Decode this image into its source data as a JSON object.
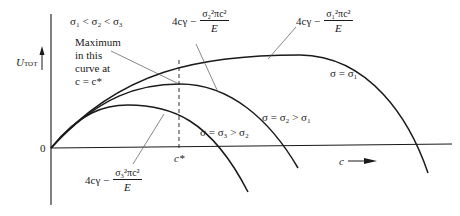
{
  "diagram": {
    "condition_label": "σ₁ < σ₂ < σ₃",
    "y_axis_label": "U",
    "y_axis_subscript": "TOT",
    "x_axis_label": "c",
    "origin_label": "0",
    "c_star_label": "c*",
    "annotation_max": [
      "Maximum",
      "in this",
      "curve at",
      "c = c*"
    ],
    "curves": [
      {
        "id": "sigma1",
        "label": "σ = σ₁",
        "formula_prefix": "4cγ −",
        "formula_num": "σ₁²πc²",
        "formula_den": "E"
      },
      {
        "id": "sigma2",
        "label": "σ = σ₂ > σ₁",
        "formula_prefix": "4cγ −",
        "formula_num": "σ₂²πc²",
        "formula_den": "E"
      },
      {
        "id": "sigma3",
        "label": "σ = σ₃ > σ₂",
        "formula_prefix": "4cγ −",
        "formula_num": "σ₃²πc²",
        "formula_den": "E"
      }
    ],
    "colors": {
      "line": "#1a1a1a",
      "leader": "#555555",
      "background": "#ffffff"
    }
  }
}
